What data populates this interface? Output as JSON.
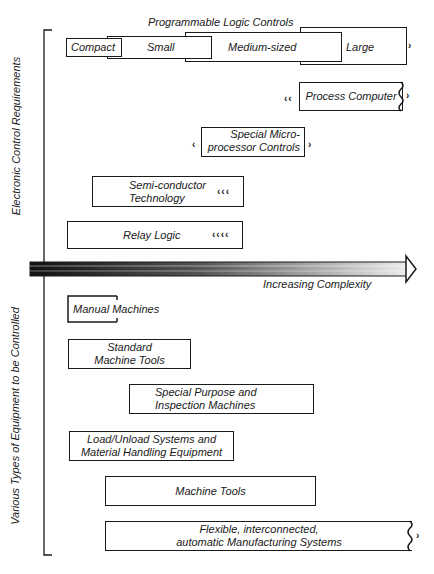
{
  "diagram": {
    "top_axis_label": "Electronic Control Requirements",
    "bottom_axis_label": "Various Types of Equipment to be Controlled",
    "complexity_arrow_label": "Increasing Complexity",
    "plc_group": {
      "title": "Programmable Logic Controls",
      "segments": [
        "Compact",
        "Small",
        "Medium-sized",
        "Large"
      ]
    },
    "control_boxes": [
      {
        "id": "process-computer",
        "label": "Process Computer"
      },
      {
        "id": "micro",
        "line1": "Special Micro-",
        "line2": "processor Controls"
      },
      {
        "id": "semiconductor",
        "line1": "Semi-conductor",
        "line2": "Technology"
      },
      {
        "id": "relay",
        "label": "Relay Logic"
      }
    ],
    "equipment_boxes": [
      {
        "id": "manual",
        "label": "Manual Machines"
      },
      {
        "id": "standard",
        "line1": "Standard",
        "line2": "Machine Tools"
      },
      {
        "id": "special",
        "line1": "Special Purpose and",
        "line2": "Inspection Machines"
      },
      {
        "id": "load",
        "line1": "Load/Unload Systems and",
        "line2": "Material Handling Equipment"
      },
      {
        "id": "machine-tools",
        "label": "Machine Tools"
      },
      {
        "id": "fms",
        "line1": "Flexible, interconnected,",
        "line2": "automatic Manufacturing Systems"
      }
    ],
    "colors": {
      "ink": "#1a1a1a",
      "background": "#ffffff"
    }
  }
}
